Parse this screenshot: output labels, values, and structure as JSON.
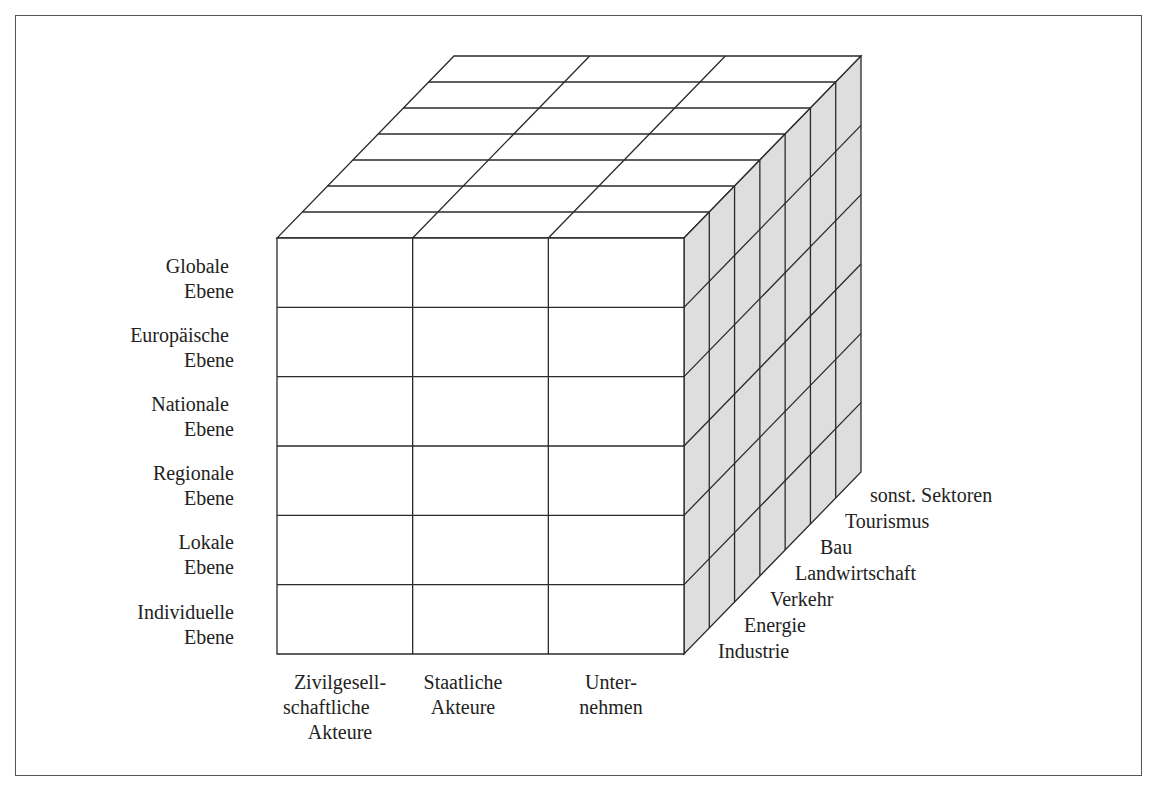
{
  "diagram": {
    "type": "3d-cube-matrix",
    "colors": {
      "stroke": "#2a2a2a",
      "front_face": "#ffffff",
      "top_face": "#ffffff",
      "side_face": "#dedede",
      "frame": "#555555"
    },
    "levels": [
      {
        "line1": "Globale",
        "line2": "Ebene"
      },
      {
        "line1": "Europäische",
        "line2": "Ebene"
      },
      {
        "line1": "Nationale",
        "line2": "Ebene"
      },
      {
        "line1": "Regionale",
        "line2": "Ebene"
      },
      {
        "line1": "Lokale",
        "line2": "Ebene"
      },
      {
        "line1": "Individuelle",
        "line2": "Ebene"
      }
    ],
    "actors": [
      {
        "lines": [
          "Zivilgesell-",
          "schaftliche",
          "Akteure"
        ]
      },
      {
        "lines": [
          "Staatliche",
          "Akteure"
        ]
      },
      {
        "lines": [
          "Unter-",
          "nehmen"
        ]
      }
    ],
    "sectors": [
      "Industrie",
      "Energie",
      "Verkehr",
      "Landwirtschaft",
      "Bau",
      "Tourismus",
      "sonst. Sektoren"
    ]
  }
}
